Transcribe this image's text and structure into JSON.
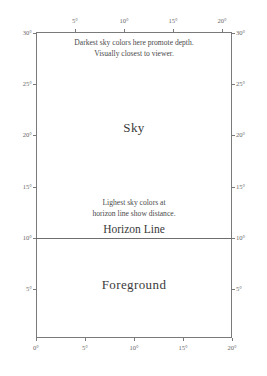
{
  "figure": {
    "regions": {
      "sky_label": "Sky",
      "foreground_label": "Foreground",
      "horizon_label": "Horizon Line"
    },
    "annotations": {
      "top": {
        "line1": "Darkest sky colors here promote depth.",
        "line2": "Visually closest to viewer."
      },
      "horizon": {
        "line1": "Lighest sky colors at",
        "line2": "horizon line show distance."
      }
    },
    "colors": {
      "box_border": "#7a7a7a",
      "horizon_rule": "#6e6e6e",
      "text": "#3a3a3a",
      "tick_text": "#6a6a6a",
      "background": "#ffffff"
    }
  },
  "chart_data": {
    "type": "table",
    "xlabel": "",
    "ylabel": "",
    "xlim": [
      0,
      20
    ],
    "ylim": [
      0,
      30
    ],
    "grid": false,
    "legend": "none",
    "axes": {
      "left": {
        "ticks": [
          30,
          25,
          20,
          15,
          10,
          5
        ],
        "tick_labels": [
          "30°",
          "25°",
          "20°",
          "15°",
          "10°",
          "5°"
        ]
      },
      "right": {
        "ticks": [
          30,
          25,
          20,
          15,
          10,
          5
        ],
        "tick_labels": [
          "30°",
          "25°",
          "20°",
          "15°",
          "10°",
          "5°"
        ]
      },
      "top": {
        "ticks": [
          5,
          10,
          15,
          20
        ],
        "tick_labels": [
          "5°",
          "10°",
          "15°",
          "20°"
        ]
      },
      "bottom": {
        "ticks": [
          0,
          5,
          10,
          15,
          20
        ],
        "tick_labels": [
          "0°",
          "5°",
          "10°",
          "15°",
          "20°"
        ]
      }
    },
    "regions": [
      {
        "name": "Sky",
        "y_range": [
          10,
          30
        ],
        "x_range": [
          0,
          20
        ],
        "label": "Sky"
      },
      {
        "name": "Foreground",
        "y_range": [
          0,
          10
        ],
        "x_range": [
          0,
          20
        ],
        "label": "Foreground"
      }
    ],
    "reference_lines": [
      {
        "name": "Horizon Line",
        "orientation": "horizontal",
        "value": 10,
        "label": "Horizon Line"
      }
    ],
    "annotations": [
      {
        "text": "Darkest sky colors here promote depth. Visually closest to viewer.",
        "x": 10,
        "y": 28.5
      },
      {
        "text": "Lighest sky colors at horizon line show distance.",
        "x": 10,
        "y": 12.5
      }
    ]
  },
  "ticks": {
    "left": [
      {
        "label": "30°",
        "top": 29
      },
      {
        "label": "25°",
        "top": 80
      },
      {
        "label": "20°",
        "top": 131
      },
      {
        "label": "15°",
        "top": 183
      },
      {
        "label": "10°",
        "top": 234
      },
      {
        "label": "5°",
        "top": 285
      }
    ],
    "right": [
      {
        "label": "30°",
        "top": 29
      },
      {
        "label": "25°",
        "top": 80
      },
      {
        "label": "20°",
        "top": 131
      },
      {
        "label": "15°",
        "top": 183
      },
      {
        "label": "10°",
        "top": 234
      },
      {
        "label": "5°",
        "top": 285
      }
    ],
    "top": [
      {
        "label": "5°",
        "left": 75
      },
      {
        "label": "10°",
        "left": 124
      },
      {
        "label": "15°",
        "left": 173
      },
      {
        "label": "20°",
        "left": 222
      }
    ],
    "bottom": [
      {
        "label": "0°",
        "left": 36
      },
      {
        "label": "5°",
        "left": 85
      },
      {
        "label": "10°",
        "left": 134
      },
      {
        "label": "15°",
        "left": 183
      },
      {
        "label": "20°",
        "left": 232
      }
    ]
  }
}
